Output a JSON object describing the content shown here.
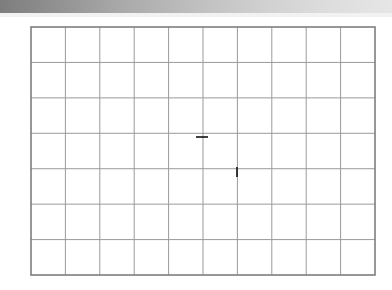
{
  "figure": {
    "background_color": "#ffffff",
    "line_color": "#111111",
    "grid_color": "#9a9a9a",
    "grid_border_color": "#8a8a8a",
    "grid": {
      "left": 31,
      "top": 27,
      "right": 375,
      "bottom": 275,
      "columns": 10,
      "rows": 7,
      "cell_width": 34.4,
      "cell_height": 35.43
    },
    "origin": {
      "x": 202,
      "y": 172,
      "unit_px": 34.4
    },
    "axes": [
      {
        "name": "x-axis",
        "x1": 36,
        "y1": 172,
        "x2": 367,
        "y2": 172,
        "arrows": "both"
      },
      {
        "name": "y-axis",
        "x1": 202,
        "y1": 272,
        "x2": 202,
        "y2": 30,
        "arrows": "both"
      }
    ],
    "ticks": [
      {
        "name": "tick-one",
        "axis": "x",
        "x": 237,
        "y": 172,
        "label": "1"
      },
      {
        "name": "tick-i",
        "axis": "y",
        "x": 202,
        "y": 137,
        "label": "i"
      }
    ],
    "axis_labels": [
      {
        "name": "x-axis-label",
        "text": "x",
        "x": 365,
        "y": 177
      },
      {
        "name": "y-axis-label",
        "text": "yi",
        "x": 170,
        "y": 32
      },
      {
        "name": "tick-i-label",
        "text": "i",
        "x": 182,
        "y": 122
      },
      {
        "name": "tick-one-label",
        "text": "1",
        "x": 233,
        "y": 179
      },
      {
        "name": "origin-label",
        "text": "O",
        "x": 180,
        "y": 178
      },
      {
        "name": "point-f-label",
        "text": "F",
        "x": 298,
        "y": 178
      }
    ],
    "vectors": [
      {
        "name": "vector-a",
        "label": "A",
        "x1": 202,
        "y1": 172,
        "x2": 333,
        "y2": 100,
        "label_x": 341,
        "label_y": 88,
        "components": [
          3.8,
          2.1
        ]
      },
      {
        "name": "vector-b",
        "label": "B",
        "x1": 202,
        "y1": 172,
        "x2": 139,
        "y2": 71,
        "label_x": 117,
        "label_y": 38,
        "components": [
          -1.8,
          2.9
        ]
      },
      {
        "name": "vector-c",
        "label": "C",
        "x1": 202,
        "y1": 172,
        "x2": 73,
        "y2": 137,
        "label_x": 44,
        "label_y": 120,
        "components": [
          -3.75,
          1.0
        ]
      },
      {
        "name": "vector-d",
        "label": "D",
        "x1": 202,
        "y1": 172,
        "x2": 142,
        "y2": 205,
        "label_x": 112,
        "label_y": 204,
        "components": [
          -1.75,
          -0.95
        ]
      },
      {
        "name": "vector-e",
        "label": "E",
        "x1": 202,
        "y1": 172,
        "x2": 237,
        "y2": 241,
        "label_x": 243,
        "label_y": 235,
        "components": [
          1.0,
          -2.0
        ]
      }
    ],
    "point_f": {
      "name": "point-f",
      "x": 305,
      "y": 172,
      "value": 3
    }
  }
}
